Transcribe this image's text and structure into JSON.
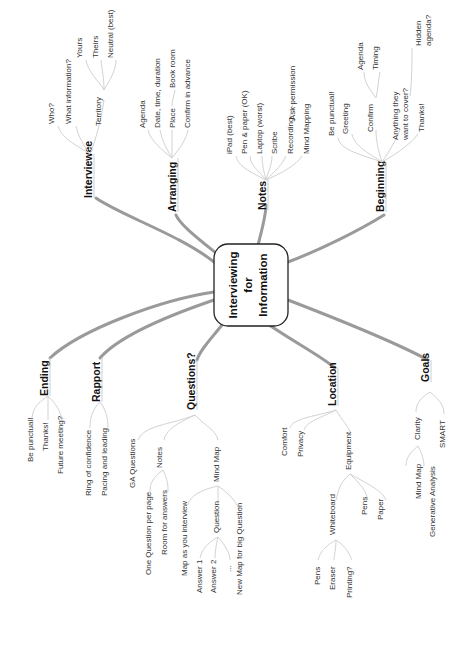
{
  "center": {
    "lines": [
      "Interviewing",
      "for",
      "Information"
    ]
  },
  "branches": {
    "interviewee": {
      "label": "Interviewee",
      "children": [
        "Who?",
        "What information?",
        "Territory"
      ],
      "territory": [
        "Yours",
        "Theirs",
        "Neutral (best)"
      ]
    },
    "arranging": {
      "label": "Arranging",
      "children": [
        "Agenda",
        "Date, time, duration",
        "Place",
        "Confirm in advance"
      ],
      "place": [
        "Book room"
      ]
    },
    "notes": {
      "label": "Notes",
      "children": [
        "iPad (best)",
        "Pen & paper (OK)",
        "Laptop (worst)",
        "Scribe",
        "Recording",
        "Mind Mapping"
      ],
      "recording": [
        "Ask permission"
      ]
    },
    "beginning": {
      "label": "Beginning",
      "children": [
        "Be punctual!",
        "Greeting",
        "Confirm",
        "Anything they",
        "want to cover?",
        "Thanks!"
      ],
      "confirm": [
        "Agenda",
        "Timing"
      ],
      "anything": [
        "Hidden",
        "agenda?"
      ]
    },
    "ending": {
      "label": "Ending",
      "children": [
        "Be punctual!",
        "Thanks!",
        "Future meeting?"
      ]
    },
    "rapport": {
      "label": "Rapport",
      "children": [
        "Ring of confidence",
        "Pacing and leading"
      ]
    },
    "questions": {
      "label": "Questions?",
      "children": [
        "GA Questions",
        "Notes",
        "Mind Map"
      ],
      "notes": [
        "One Question per page",
        "Room for answers"
      ],
      "mindmap": [
        "Map as you interview",
        "Question",
        "New Map for big Question"
      ],
      "question": [
        "Answer 1",
        "Answer 2",
        "..."
      ]
    },
    "location": {
      "label": "Location",
      "children": [
        "Comfort",
        "Privacy",
        "Equipment"
      ],
      "equipment": [
        "Whiteboard",
        "Pens",
        "Paper"
      ],
      "whiteboard": [
        "Pens",
        "Eraser",
        "Printing?"
      ]
    },
    "goals": {
      "label": "Goals",
      "children": [
        "Clarity",
        "SMART"
      ],
      "clarity": [
        "Mind Map",
        "Generative Analysis"
      ]
    }
  },
  "colors": {
    "branch": "#9a9a9a",
    "twig": "#d2d2d2",
    "text": "#333333",
    "background": "#ffffff"
  }
}
